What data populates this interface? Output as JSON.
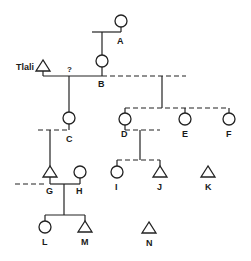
{
  "diagram": {
    "type": "kinship-chart",
    "legend_conventions": {
      "circle": "female",
      "triangle": "male",
      "solid_line": "known relationship",
      "dashed_line": "uncertain / other relationship"
    },
    "labels": {
      "A": "A",
      "B": "B",
      "C": "C",
      "D": "D",
      "E": "E",
      "F": "F",
      "G": "G",
      "H": "H",
      "I": "I",
      "J": "J",
      "K": "K",
      "L": "L",
      "M": "M",
      "N": "N",
      "tlali": "Tlali",
      "question": "?"
    },
    "nodes": [
      {
        "id": "A",
        "shape": "circle"
      },
      {
        "id": "B",
        "shape": "circle"
      },
      {
        "id": "Tlali",
        "shape": "triangle"
      },
      {
        "id": "C",
        "shape": "circle"
      },
      {
        "id": "D",
        "shape": "circle"
      },
      {
        "id": "E",
        "shape": "circle"
      },
      {
        "id": "F",
        "shape": "circle"
      },
      {
        "id": "G",
        "shape": "triangle"
      },
      {
        "id": "H",
        "shape": "circle"
      },
      {
        "id": "I",
        "shape": "circle"
      },
      {
        "id": "J",
        "shape": "triangle"
      },
      {
        "id": "K",
        "shape": "triangle"
      },
      {
        "id": "L",
        "shape": "circle"
      },
      {
        "id": "M",
        "shape": "triangle"
      },
      {
        "id": "N",
        "shape": "triangle"
      }
    ]
  }
}
